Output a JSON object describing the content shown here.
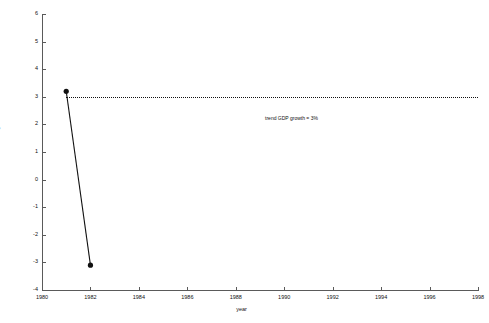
{
  "chart_data": {
    "type": "line",
    "title": "",
    "xlabel": "year",
    "ylabel": "% change",
    "xlim": [
      1980,
      1998
    ],
    "ylim": [
      -4,
      6
    ],
    "grid": false,
    "legend": "none",
    "x_ticks": [
      1980,
      1982,
      1984,
      1986,
      1988,
      1990,
      1992,
      1994,
      1996,
      1998
    ],
    "x_tick_labels": [
      "1980",
      "1982",
      "1984",
      "1986",
      "1988",
      "1990",
      "1992",
      "1994",
      "1996",
      "1998"
    ],
    "y_ticks": [
      6,
      5,
      4,
      3,
      2,
      1,
      0,
      -1,
      -2,
      -3,
      -4
    ],
    "y_tick_labels": [
      "6",
      "5",
      "4",
      "3",
      "2",
      "1",
      "0",
      "-1",
      "-2",
      "-3",
      "-4"
    ],
    "series": [
      {
        "name": "% change",
        "marker": "filled-circle",
        "color": "#111111",
        "x": [
          1981,
          1982
        ],
        "values": [
          3.2,
          -3.1
        ]
      }
    ],
    "reference_lines": [
      {
        "name": "trend-gdp-growth",
        "orientation": "horizontal",
        "value": 3,
        "style": "dotted",
        "color": "#111111",
        "x_start": 1981,
        "x_end": 1998,
        "label": "trend GDP growth = 3%"
      }
    ],
    "annotations": [
      {
        "text": "trend GDP growth = 3%",
        "x": 1990.3,
        "y": 2.35
      }
    ]
  }
}
